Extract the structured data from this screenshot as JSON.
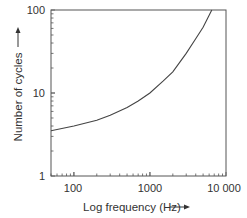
{
  "chart_data": {
    "type": "line",
    "title": "",
    "xlabel": "Log frequency (Hz)",
    "ylabel": "Number of cycles",
    "xscale": "log",
    "yscale": "log",
    "xlim": [
      50,
      10000
    ],
    "ylim": [
      1,
      100
    ],
    "x_ticks": [
      "100",
      "1000",
      "10 000"
    ],
    "y_ticks": [
      "1",
      "10",
      "100"
    ],
    "grid": false,
    "legend": null,
    "series": [
      {
        "name": "cycles vs frequency",
        "x": [
          50,
          100,
          200,
          300,
          500,
          700,
          1000,
          1500,
          2000,
          3000,
          4000,
          5000,
          6500
        ],
        "y": [
          3.5,
          4.0,
          4.7,
          5.4,
          6.7,
          8.0,
          10.0,
          14.0,
          18.0,
          30.0,
          45.0,
          62.0,
          100.0
        ]
      }
    ]
  }
}
